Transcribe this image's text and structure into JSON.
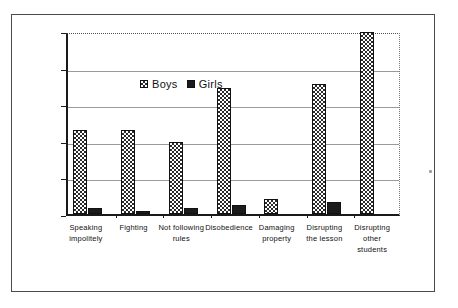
{
  "chart_data": {
    "type": "bar",
    "title": "",
    "xlabel": "",
    "ylabel": "% of all  Disruptions",
    "ylim": [
      0,
      25
    ],
    "ytick_values": [
      25,
      20,
      15,
      10,
      5,
      0
    ],
    "ytick_labels": [
      "25",
      "20",
      "15",
      "10",
      "5",
      "0"
    ],
    "grid": true,
    "legend_position": "top-left inside plot",
    "categories": [
      "Speaking impolitely",
      "Fighting",
      "Not following rules",
      "Disobedience",
      "Damaging property",
      "Disrupting the lesson",
      "Disrupting other students"
    ],
    "category_lines": [
      [
        "Speaking",
        "impolitely"
      ],
      [
        "Fighting"
      ],
      [
        "Not following",
        "rules"
      ],
      [
        "Disobedience"
      ],
      [
        "Damaging",
        "property"
      ],
      [
        "Disrupting",
        "the lesson"
      ],
      [
        "Disrupting",
        "other",
        "students"
      ]
    ],
    "series": [
      {
        "name": "Boys",
        "color": "#2b2b2b",
        "pattern": "checkerboard",
        "values": [
          11.5,
          11.5,
          9.8,
          17.2,
          2.0,
          17.7,
          24.8
        ]
      },
      {
        "name": "Girls",
        "color": "#1b1b1b",
        "pattern": "solid",
        "values": [
          0.8,
          0.4,
          0.8,
          1.2,
          0.0,
          1.7,
          0.0
        ]
      }
    ]
  },
  "legend": {
    "entries": [
      {
        "label": "Boys"
      },
      {
        "label": "Girls"
      }
    ]
  },
  "axis": {
    "y_title": "% of all  Disruptions"
  }
}
